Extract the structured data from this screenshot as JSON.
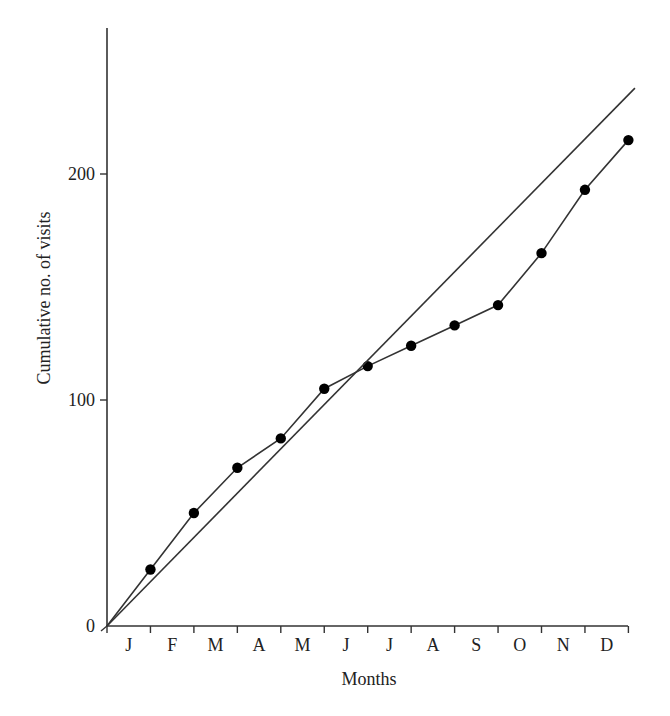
{
  "chart_data": {
    "type": "line",
    "title": "",
    "xlabel": "Months",
    "ylabel": "Cumulative no. of visits",
    "categories": [
      "J",
      "F",
      "M",
      "A",
      "M",
      "J",
      "J",
      "A",
      "S",
      "O",
      "N",
      "D"
    ],
    "yticks": [
      0,
      100,
      200
    ],
    "ylim": [
      0,
      265
    ],
    "grid": false,
    "legend": null,
    "series": [
      {
        "name": "Observed cumulative visits",
        "style": "line-with-markers",
        "x": [
          0,
          1,
          2,
          3,
          4,
          5,
          6,
          7,
          8,
          9,
          10,
          11,
          12
        ],
        "values": [
          0,
          25,
          50,
          70,
          83,
          105,
          115,
          124,
          133,
          142,
          165,
          193,
          215
        ]
      },
      {
        "name": "Expected (constant rate) line",
        "style": "straight-line",
        "x": [
          0,
          12.15
        ],
        "values": [
          0,
          238
        ]
      }
    ]
  },
  "labels": {
    "xlabel": "Months",
    "ylabel": "Cumulative no. of visits",
    "ytick_0": "0",
    "ytick_100": "100",
    "ytick_200": "200",
    "months": [
      "J",
      "F",
      "M",
      "A",
      "M",
      "J",
      "J",
      "A",
      "S",
      "O",
      "N",
      "D"
    ]
  },
  "colors": {
    "line": "#333333",
    "marker": "#000000",
    "axis": "#333333",
    "background": "#ffffff"
  }
}
